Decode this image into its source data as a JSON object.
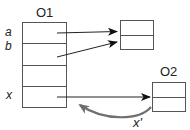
{
  "diagram": {
    "objects": [
      {
        "id": "O1",
        "label": "O1",
        "fields": [
          "a",
          "b",
          "",
          "x"
        ]
      },
      {
        "id": "target1",
        "label": "",
        "fields": [
          "",
          ""
        ]
      },
      {
        "id": "O2",
        "label": "O2",
        "fields": [
          "",
          ""
        ]
      }
    ],
    "field_labels": {
      "a": "a",
      "b": "b",
      "x": "x"
    },
    "edge_labels": {
      "x_prime": "x'"
    },
    "colors": {
      "box_stroke": "#555555",
      "arrow": "#222222",
      "curved_arrow": "#707070"
    }
  }
}
